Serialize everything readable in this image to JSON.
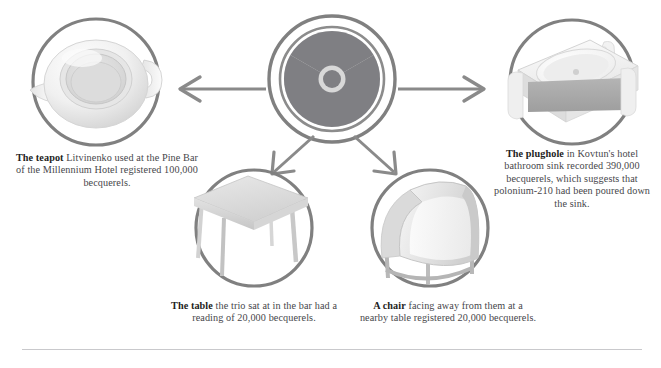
{
  "figure": {
    "type": "diagram",
    "center_icon": "radiation-trefoil-icon",
    "background_color": "#ffffff",
    "stroke_color": "#808080",
    "trefoil_blade_color": "#7f7f83",
    "trefoil_disc_color": "#d8d8d8"
  },
  "nodes": {
    "teapot": {
      "icon": "teapot-icon",
      "lead": "The teapot",
      "body": " Litvinenko used at the Pine Bar of the Millennium Hotel registered 100,000 becquerels.",
      "reading": "100,000 becquerels",
      "location": "Pine Bar, Millennium Hotel"
    },
    "plughole": {
      "icon": "sink-plughole-icon",
      "lead": "The plughole",
      "body": " in Kovtun's hotel bathroom sink recorded 390,000 becquerels, which suggests that polonium-210 had been poured down the sink.",
      "reading": "390,000 becquerels",
      "location": "Kovtun's hotel bathroom sink"
    },
    "table": {
      "icon": "table-icon",
      "lead": "The table",
      "body": " the trio sat at in the bar had a reading of 20,000 becquerels.",
      "reading": "20,000 becquerels",
      "location": "the bar"
    },
    "chair": {
      "icon": "chair-icon",
      "lead": "A chair",
      "body": " facing away from them at a nearby table registered 20,000 becquerels.",
      "reading": "20,000 becquerels",
      "location": "a nearby table"
    }
  },
  "arrows": [
    {
      "name": "arrow-to-teapot",
      "direction": "left"
    },
    {
      "name": "arrow-to-plughole",
      "direction": "right"
    },
    {
      "name": "arrow-to-table",
      "direction": "down-left"
    },
    {
      "name": "arrow-to-chair",
      "direction": "down-right"
    }
  ]
}
